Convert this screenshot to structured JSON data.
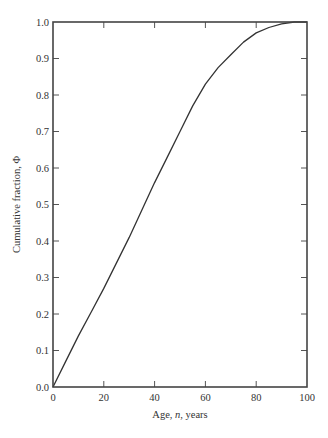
{
  "chart_data": {
    "type": "line",
    "title": "",
    "xlabel": "Age, n, years",
    "xlabel_parts": [
      "Age, ",
      "n",
      ", years"
    ],
    "ylabel": "Cumulative fraction, Φ",
    "xlim": [
      0,
      100
    ],
    "ylim": [
      0,
      1.0
    ],
    "x_ticks": [
      0,
      20,
      40,
      60,
      80,
      100
    ],
    "x_tick_labels": [
      "0",
      "20",
      "40",
      "60",
      "80",
      "100"
    ],
    "y_ticks": [
      0.0,
      0.1,
      0.2,
      0.3,
      0.4,
      0.5,
      0.6,
      0.7,
      0.8,
      0.9,
      1.0
    ],
    "y_tick_labels": [
      "0.0",
      "0.1",
      "0.2",
      "0.3",
      "0.4",
      "0.5",
      "0.6",
      "0.7",
      "0.8",
      "0.9",
      "1.0"
    ],
    "grid": false,
    "legend": null,
    "series": [
      {
        "name": "Cumulative fraction",
        "color": "#333333",
        "x": [
          0,
          5,
          10,
          15,
          20,
          25,
          30,
          35,
          40,
          45,
          50,
          55,
          60,
          65,
          70,
          75,
          80,
          85,
          90,
          95,
          100
        ],
        "values": [
          0.0,
          0.07,
          0.14,
          0.205,
          0.27,
          0.34,
          0.41,
          0.485,
          0.56,
          0.63,
          0.7,
          0.77,
          0.83,
          0.875,
          0.91,
          0.945,
          0.97,
          0.985,
          0.995,
          1.0,
          1.0
        ]
      }
    ]
  }
}
